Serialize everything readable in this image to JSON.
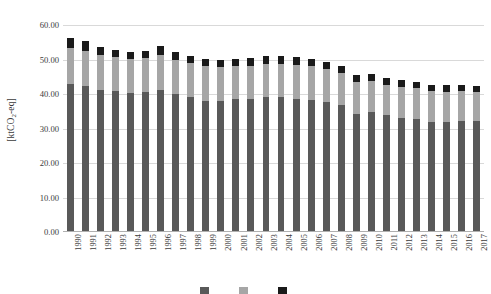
{
  "chart_data": {
    "type": "bar",
    "stacked": true,
    "title": "",
    "subtitle": "",
    "xlabel": "",
    "ylabel": "[ktCO2-eq]",
    "ylabel_display": "[ktCO",
    "ylabel_sub": "2",
    "ylabel_tail": "-eq]",
    "ylim": [
      0,
      60
    ],
    "ytick_step": 10,
    "grid": true,
    "legend_position": "bottom",
    "categories": [
      "1990",
      "1991",
      "1992",
      "1993",
      "1994",
      "1995",
      "1996",
      "1997",
      "1998",
      "1999",
      "2000",
      "2001",
      "2002",
      "2003",
      "2004",
      "2005",
      "2006",
      "2007",
      "2008",
      "2009",
      "2010",
      "2011",
      "2012",
      "2013",
      "2014",
      "2015",
      "2016",
      "2017"
    ],
    "ytick_labels": [
      "0.00",
      "10.00",
      "20.00",
      "30.00",
      "40.00",
      "50.00",
      "60.00"
    ],
    "ytick_values": [
      0,
      10,
      20,
      30,
      40,
      50,
      60
    ],
    "series": [
      {
        "name": "segment-bottom",
        "color": "#595959",
        "values": [
          42.8,
          42.4,
          41.2,
          40.9,
          40.3,
          40.6,
          41.2,
          40.1,
          39.1,
          38.0,
          37.9,
          38.6,
          38.5,
          39.0,
          39.1,
          38.7,
          38.4,
          37.8,
          36.8,
          34.2,
          34.8,
          33.8,
          33.1,
          32.8,
          32.0,
          32.0,
          32.2,
          32.1
        ]
      },
      {
        "name": "segment-middle",
        "color": "#a6a6a6",
        "values": [
          10.4,
          10.2,
          10.2,
          9.8,
          9.8,
          9.7,
          10.0,
          9.7,
          9.9,
          10.0,
          9.8,
          9.5,
          9.7,
          9.6,
          9.5,
          9.6,
          9.6,
          9.4,
          9.2,
          9.4,
          9.1,
          8.9,
          9.0,
          8.9,
          8.8,
          8.7,
          8.6,
          8.5
        ]
      },
      {
        "name": "segment-top",
        "color": "#1a1a1a",
        "values": [
          2.9,
          2.7,
          2.2,
          2.1,
          2.1,
          2.2,
          2.6,
          2.4,
          2.1,
          2.1,
          2.1,
          2.2,
          2.3,
          2.3,
          2.3,
          2.3,
          2.2,
          2.1,
          2.1,
          1.9,
          2.0,
          2.0,
          1.9,
          1.9,
          1.8,
          1.8,
          1.8,
          1.7
        ]
      }
    ],
    "totals": [
      56.1,
      55.3,
      53.6,
      52.8,
      52.2,
      52.5,
      53.8,
      52.2,
      51.1,
      50.1,
      49.8,
      50.3,
      50.5,
      50.9,
      50.9,
      50.6,
      50.2,
      49.3,
      48.1,
      45.5,
      45.9,
      44.7,
      44.0,
      43.6,
      42.6,
      42.5,
      42.6,
      42.3
    ]
  },
  "legend": {
    "entries": [
      {
        "label": "",
        "color": "#595959"
      },
      {
        "label": "",
        "color": "#a6a6a6"
      },
      {
        "label": "",
        "color": "#1a1a1a"
      }
    ],
    "note": "legend clipped at bottom edge of image"
  }
}
